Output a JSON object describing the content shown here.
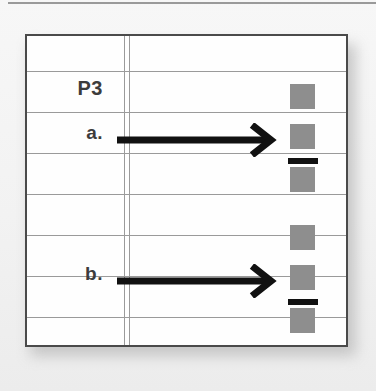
{
  "page": {
    "title": "P3",
    "background_color": "#f2f2f2",
    "paper_color": "#fefefe",
    "rule_color": "#9a9a9a",
    "border_color": "#4a4a4a",
    "ink_color": "#111111",
    "token_color": "#8e8e8e"
  },
  "table": {
    "header_label": "P3",
    "column_divider": "double-vertical-rule",
    "rule_line_count": 8,
    "rule_lines_y": [
      35,
      76,
      117,
      158,
      199,
      240,
      281,
      312
    ]
  },
  "rows": [
    {
      "id": "a",
      "label": "a.",
      "arrow": {
        "direction": "right",
        "style": "thick-line-with-chevron-head",
        "color": "#111111"
      },
      "tokens": [
        {
          "type": "square",
          "color": "#8e8e8e"
        },
        {
          "type": "square",
          "color": "#8e8e8e"
        },
        {
          "type": "bar",
          "color": "#111111"
        },
        {
          "type": "square",
          "color": "#8e8e8e"
        }
      ]
    },
    {
      "id": "b",
      "label": "b.",
      "arrow": {
        "direction": "right",
        "style": "thick-line-with-chevron-head",
        "color": "#111111"
      },
      "tokens": [
        {
          "type": "square",
          "color": "#8e8e8e"
        },
        {
          "type": "square",
          "color": "#8e8e8e"
        },
        {
          "type": "bar",
          "color": "#111111"
        },
        {
          "type": "square",
          "color": "#8e8e8e"
        }
      ]
    }
  ]
}
